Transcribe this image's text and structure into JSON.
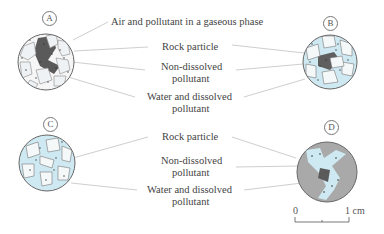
{
  "figure": {
    "panels": [
      {
        "id": "A",
        "letter": "A",
        "description": "Soil pores containing air/gas, water and dissolved pollutant, and non-dissolved pollutant"
      },
      {
        "id": "B",
        "letter": "B",
        "description": "Soil pores mostly water-filled with dissolved and non-dissolved pollutant"
      },
      {
        "id": "C",
        "letter": "C",
        "description": "Saturated soil: pores filled with water and dissolved pollutant"
      },
      {
        "id": "D",
        "letter": "D",
        "description": "Fractured rock with water and dissolved pollutant and non-dissolved pollutant in fractures"
      }
    ],
    "top_labels": {
      "gas": "Air and pollutant in a gaseous phase",
      "rock": "Rock particle",
      "nondissolved_1": "Non-dissolved",
      "nondissolved_2": "pollutant",
      "water_1": "Water and dissolved",
      "water_2": "pollutant"
    },
    "bottom_labels": {
      "rock": "Rock particle",
      "nondissolved_1": "Non-dissolved",
      "nondissolved_2": "pollutant",
      "water_1": "Water and dissolved",
      "water_2": "pollutant"
    },
    "scale_bar": {
      "start": "0",
      "end": "1 cm"
    },
    "colors": {
      "water": "#cfe9f2",
      "rock_grain": "#f4f7f8",
      "nondissolved": "#5a5a5a",
      "rock_mass": "#a9a9a9",
      "outline": "#666666",
      "leader_line": "#bdbdbd"
    }
  }
}
